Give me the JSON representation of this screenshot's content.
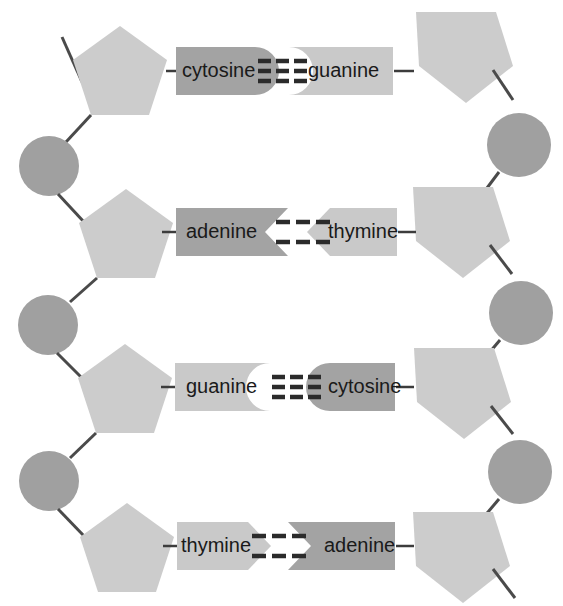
{
  "diagram": {
    "width": 563,
    "height": 606,
    "background_color": "#ffffff"
  },
  "colors": {
    "sugar_pentagon": "#cccccc",
    "phosphate_circle": "#a0a0a0",
    "base_light": "#c9c9c9",
    "base_dark": "#a3a3a3",
    "line": "#4a4a4a",
    "hbond": "#2b2b2b",
    "text": "#1a1a1a"
  },
  "legend_semantics": {
    "pentagon": "deoxyribose-sugar",
    "circle": "phosphate-group",
    "box": "nitrogenous-base",
    "dashes": "hydrogen-bond"
  },
  "rungs": [
    {
      "id": "rung-1",
      "left_base": "cytosine",
      "right_base": "guanine",
      "left_shade": "dark",
      "right_shade": "light",
      "joint": "round",
      "hydrogen_bonds": 3,
      "bond_rows": 3,
      "bond_columns": 3,
      "y": 71
    },
    {
      "id": "rung-2",
      "left_base": "adenine",
      "right_base": "thymine",
      "left_shade": "dark",
      "right_shade": "light",
      "joint": "chevron",
      "hydrogen_bonds": 2,
      "bond_rows": 2,
      "bond_columns": 3,
      "y": 232
    },
    {
      "id": "rung-3",
      "left_base": "guanine",
      "right_base": "cytosine",
      "left_shade": "light",
      "right_shade": "dark",
      "joint": "round",
      "hydrogen_bonds": 3,
      "bond_rows": 3,
      "bond_columns": 3,
      "y": 387
    },
    {
      "id": "rung-4",
      "left_base": "thymine",
      "right_base": "adenine",
      "left_shade": "light",
      "right_shade": "dark",
      "joint": "chevron",
      "hydrogen_bonds": 2,
      "bond_rows": 2,
      "bond_columns": 3,
      "y": 546
    }
  ],
  "left_strand": {
    "name": "left-backbone",
    "sugars": 4,
    "phosphates": 3,
    "terminus_top": "free-bond-up-left",
    "terminus_bottom": "none"
  },
  "right_strand": {
    "name": "right-backbone",
    "sugars": 4,
    "phosphates": 3,
    "terminus_top": "none",
    "terminus_bottom": "free-bond-down-right"
  }
}
